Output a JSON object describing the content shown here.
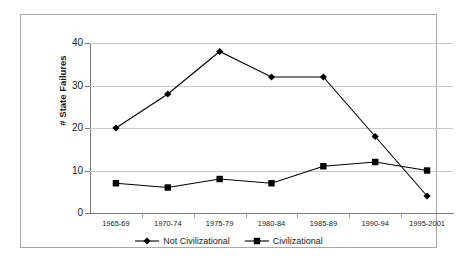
{
  "chart_data": {
    "type": "line",
    "title": "",
    "xlabel": "",
    "ylabel": "# State Failures",
    "categories": [
      "1965-69",
      "1970-74",
      "1975-79",
      "1980-84",
      "1985-89",
      "1990-94",
      "1995-2001"
    ],
    "ylim": [
      0,
      40
    ],
    "yticks": [
      0,
      10,
      20,
      30,
      40
    ],
    "ytick_labels": [
      "0",
      "10",
      "20",
      "30",
      "40"
    ],
    "grid": true,
    "legend_position": "bottom",
    "series": [
      {
        "name": "Not Civilizational",
        "marker": "diamond",
        "color": "#000000",
        "values": [
          20,
          28,
          38,
          32,
          32,
          18,
          4
        ]
      },
      {
        "name": "Civilizational",
        "marker": "square",
        "color": "#000000",
        "values": [
          7,
          6,
          8,
          7,
          11,
          12,
          10
        ]
      }
    ]
  }
}
